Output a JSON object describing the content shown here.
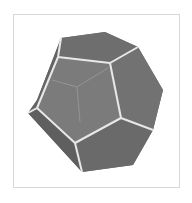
{
  "figure": {
    "colors": {
      "background": "#ffffff",
      "frame_border": "#d8d8d8",
      "face_front": "#7a7a7a",
      "face_side_dark": "#6a6a6a",
      "face_top": "#707070",
      "edge_visible": "#e6e6e6",
      "edge_hidden": "#9a9a9a"
    }
  }
}
